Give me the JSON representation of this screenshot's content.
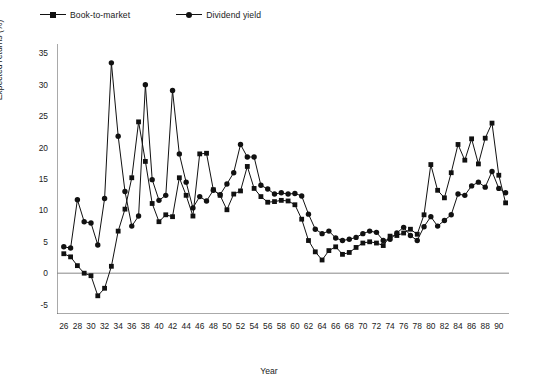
{
  "chart_data": {
    "type": "line",
    "title": "",
    "xlabel": "Year",
    "ylabel": "Expected returns (%)",
    "xlim": [
      25,
      91.5
    ],
    "ylim": [
      -6.5,
      36.5
    ],
    "yticks": [
      -5,
      0,
      5,
      10,
      15,
      20,
      25,
      30,
      35
    ],
    "xticks": [
      26,
      27,
      28,
      29,
      30,
      31,
      32,
      33,
      34,
      35,
      36,
      37,
      38,
      39,
      40,
      41,
      42,
      43,
      44,
      45,
      46,
      47,
      48,
      49,
      50,
      51,
      52,
      53,
      54,
      55,
      56,
      57,
      58,
      59,
      60,
      61,
      62,
      63,
      64,
      65,
      66,
      67,
      68,
      69,
      70,
      71,
      72,
      73,
      74,
      75,
      76,
      77,
      78,
      79,
      80,
      81,
      82,
      83,
      84,
      85,
      86,
      87,
      88,
      89,
      90,
      91
    ],
    "xtick_labels": [
      "26",
      "",
      "28",
      "",
      "30",
      "",
      "32",
      "",
      "34",
      "",
      "36",
      "",
      "38",
      "",
      "40",
      "",
      "42",
      "",
      "44",
      "",
      "46",
      "",
      "48",
      "",
      "50",
      "",
      "52",
      "",
      "54",
      "",
      "56",
      "",
      "58",
      "",
      "60",
      "",
      "62",
      "",
      "64",
      "",
      "66",
      "",
      "68",
      "",
      "70",
      "",
      "72",
      "",
      "74",
      "",
      "76",
      "",
      "78",
      "",
      "80",
      "",
      "82",
      "",
      "84",
      "",
      "86",
      "",
      "88",
      "",
      "90",
      ""
    ],
    "grid": false,
    "zero_line": true,
    "legend_position": "top-left",
    "x": [
      26,
      27,
      28,
      29,
      30,
      31,
      32,
      33,
      34,
      35,
      36,
      37,
      38,
      39,
      40,
      41,
      42,
      43,
      44,
      45,
      46,
      47,
      48,
      49,
      50,
      51,
      52,
      53,
      54,
      55,
      56,
      57,
      58,
      59,
      60,
      61,
      62,
      63,
      64,
      65,
      66,
      67,
      68,
      69,
      70,
      71,
      72,
      73,
      74,
      75,
      76,
      77,
      78,
      79,
      80,
      81,
      82,
      83,
      84,
      85,
      86,
      87,
      88,
      89,
      90,
      91
    ],
    "series": [
      {
        "name": "Book-to-market",
        "marker": "square",
        "color": "#111111",
        "values": [
          3.1,
          2.6,
          1.2,
          0.0,
          -0.4,
          -3.6,
          -2.4,
          1.1,
          6.7,
          10.2,
          15.2,
          24.1,
          17.8,
          11.1,
          8.2,
          9.3,
          9.0,
          15.2,
          12.4,
          9.1,
          19.0,
          19.1,
          13.3,
          12.4,
          10.1,
          12.6,
          13.1,
          17.0,
          13.5,
          12.2,
          11.3,
          11.4,
          11.6,
          11.5,
          10.9,
          8.6,
          5.2,
          3.4,
          2.1,
          3.6,
          4.2,
          3.0,
          3.3,
          4.1,
          4.8,
          5.0,
          4.8,
          4.4,
          5.9,
          6.0,
          6.4,
          7.0,
          6.2,
          9.3,
          17.3,
          13.2,
          12.0,
          16.0,
          20.5,
          18.0,
          21.4,
          17.4,
          21.5,
          23.9,
          15.6,
          11.2
        ]
      },
      {
        "name": "Dividend yield",
        "marker": "circle",
        "color": "#111111",
        "values": [
          4.2,
          4.0,
          11.7,
          8.2,
          8.0,
          4.5,
          11.9,
          33.5,
          21.8,
          13.0,
          7.5,
          9.1,
          30.0,
          14.9,
          11.6,
          12.4,
          29.1,
          19.0,
          14.5,
          10.4,
          12.2,
          11.5,
          13.2,
          12.5,
          14.2,
          16.0,
          20.5,
          18.5,
          18.5,
          14.0,
          13.4,
          12.6,
          12.8,
          12.6,
          12.7,
          12.3,
          9.4,
          7.0,
          6.3,
          6.7,
          5.6,
          5.2,
          5.4,
          5.7,
          6.3,
          6.7,
          6.5,
          5.2,
          5.4,
          6.4,
          7.3,
          6.0,
          5.2,
          7.4,
          9.0,
          7.5,
          8.4,
          9.3,
          12.6,
          12.4,
          13.9,
          14.5,
          13.7,
          16.2,
          13.5,
          12.8
        ]
      }
    ],
    "series_tail": {
      "Book-to-market": [
        5.3,
        4.9,
        1.5,
        2.6,
        3.0,
        1.4,
        1.4,
        1.3
      ],
      "Dividend yield": [
        10.4,
        8.3,
        5.6,
        4.0,
        4.3,
        6.8,
        6.6,
        6.1,
        5.2,
        4.4
      ]
    }
  },
  "caption": {
    "text": ""
  }
}
